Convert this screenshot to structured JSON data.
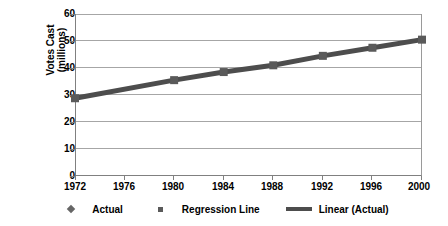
{
  "chart_data": {
    "type": "line",
    "title": "",
    "subtitle": "",
    "xlabel": "",
    "ylabel": "Votes Cast\n(millions)",
    "x": [
      1972,
      1976,
      1980,
      1984,
      1988,
      1992,
      1996,
      2000
    ],
    "xtick_labels": [
      "1972",
      "1976",
      "1980",
      "1984",
      "1988",
      "1992",
      "1996",
      "2000"
    ],
    "xlim": [
      1972,
      2000
    ],
    "ylim": [
      0,
      60
    ],
    "ytick_labels": [
      "0",
      "10",
      "20",
      "30",
      "40",
      "50",
      "60"
    ],
    "ytick_values": [
      0,
      10,
      20,
      30,
      40,
      50,
      60
    ],
    "grid": true,
    "grid_axis": "y",
    "legend_position": "bottom",
    "series": [
      {
        "name": "Actual",
        "marker": "diamond",
        "x": [
          1972,
          1980,
          1984,
          1988,
          1992,
          1996,
          2000
        ],
        "values": [
          28.8,
          35.5,
          38.5,
          41.0,
          44.5,
          47.5,
          50.5
        ]
      },
      {
        "name": "Regression Line",
        "marker": "square",
        "x": [
          1972,
          1980,
          1984,
          1988,
          1992,
          1996,
          2000
        ],
        "values": [
          28.8,
          35.5,
          38.5,
          41.0,
          44.5,
          47.5,
          50.5
        ]
      },
      {
        "name": "Linear (Actual)",
        "marker": "line",
        "x": [
          1972,
          2000
        ],
        "values": [
          28.8,
          50.5
        ]
      }
    ]
  },
  "legend": {
    "items": [
      {
        "label": "Actual",
        "key": "diamond-marker-icon",
        "color": "#666666"
      },
      {
        "label": "Regression Line",
        "key": "square-marker-icon",
        "color": "#5a5a5a"
      },
      {
        "label": "Linear (Actual)",
        "key": "trend-line-icon",
        "color": "#4d4d4d"
      }
    ]
  },
  "axes": {
    "y_title": "Votes Cast\n(millions)",
    "y_labels": [
      "60",
      "50",
      "40",
      "30",
      "20",
      "10",
      "0"
    ],
    "x_labels": [
      "1972",
      "1976",
      "1980",
      "1984",
      "1988",
      "1992",
      "1996",
      "2000"
    ]
  },
  "style": {
    "background": "#ffffff",
    "gridline_color": "#a6a6a6",
    "axis_color": "#808080",
    "series_color": "#4d4d4d",
    "marker_color": "#5a5a5a",
    "text_color": "#000000"
  }
}
